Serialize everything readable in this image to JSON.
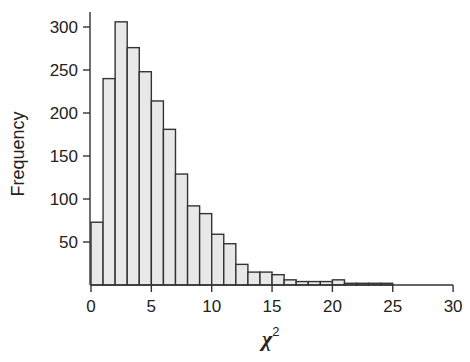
{
  "chart_data": {
    "type": "bar",
    "title": "",
    "xlabel": "χ",
    "xlabel_superscript": "2",
    "ylabel": "Frequency",
    "bin_width": 1,
    "bin_starts": [
      0,
      1,
      2,
      3,
      4,
      5,
      6,
      7,
      8,
      9,
      10,
      11,
      12,
      13,
      14,
      15,
      16,
      17,
      18,
      19,
      20,
      21,
      22,
      23,
      24
    ],
    "values": [
      73,
      240,
      306,
      276,
      248,
      214,
      181,
      129,
      92,
      83,
      59,
      48,
      24,
      15,
      15,
      12,
      6,
      4,
      4,
      4,
      6,
      2,
      2,
      2,
      2
    ],
    "xlim": [
      0,
      30
    ],
    "ylim": [
      0,
      320
    ],
    "xticks": [
      0,
      5,
      10,
      15,
      20,
      25,
      30
    ],
    "yticks": [
      50,
      100,
      150,
      200,
      250,
      300
    ],
    "grid": false,
    "legend": null,
    "bar_fill": "#e8e8e8",
    "bar_stroke": "#333333"
  }
}
